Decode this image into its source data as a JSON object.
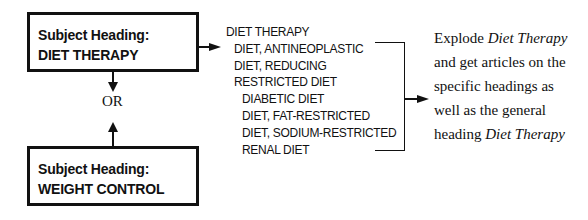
{
  "box_top": {
    "label": "Subject Heading:",
    "heading": "DIET THERAPY"
  },
  "connector": {
    "or_label": "OR"
  },
  "box_bottom": {
    "label": "Subject Heading:",
    "heading": "WEIGHT CONTROL"
  },
  "tree": {
    "items": [
      {
        "label": "DIET THERAPY",
        "level": 0
      },
      {
        "label": "DIET, ANTINEOPLASTIC",
        "level": 1
      },
      {
        "label": "DIET, REDUCING",
        "level": 1
      },
      {
        "label": "RESTRICTED DIET",
        "level": 1
      },
      {
        "label": "DIABETIC DIET",
        "level": 2
      },
      {
        "label": "DIET, FAT-RESTRICTED",
        "level": 2
      },
      {
        "label": "DIET, SODIUM-RESTRICTED",
        "level": 2
      },
      {
        "label": "RENAL DIET",
        "level": 2
      }
    ]
  },
  "explanation": {
    "line1_pre": "Explode ",
    "line1_em": "Diet Therapy",
    "line2": "and get articles on the",
    "line3": "specific headings as",
    "line4": "well as the general",
    "line5_pre": "heading ",
    "line5_em": "Diet Therapy"
  }
}
